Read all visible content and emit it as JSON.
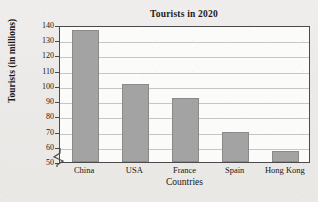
{
  "chart_data": {
    "type": "bar",
    "title": "Tourists in 2020",
    "xlabel": "Countries",
    "ylabel": "Tourists (in millions)",
    "categories": [
      "China",
      "USA",
      "France",
      "Spain",
      "Hong Kong"
    ],
    "values": [
      137,
      101,
      92,
      70,
      57
    ],
    "ylim": [
      50,
      140
    ],
    "ytick_labels": [
      "140",
      "130",
      "120",
      "110",
      "100",
      "90",
      "80",
      "70",
      "60",
      "50"
    ],
    "ytick_values": [
      140,
      130,
      120,
      110,
      100,
      90,
      80,
      70,
      60,
      50
    ],
    "grid": true,
    "axis_break": true,
    "legend": "none",
    "bar_color": "#a3a3a3",
    "bar_border_color": "#8a8a8a",
    "gridline_color": "#c6c6c4",
    "frame_color": "#4a4a4a",
    "plot_background": "#fbfbfa",
    "figure_background": "#edecea"
  }
}
